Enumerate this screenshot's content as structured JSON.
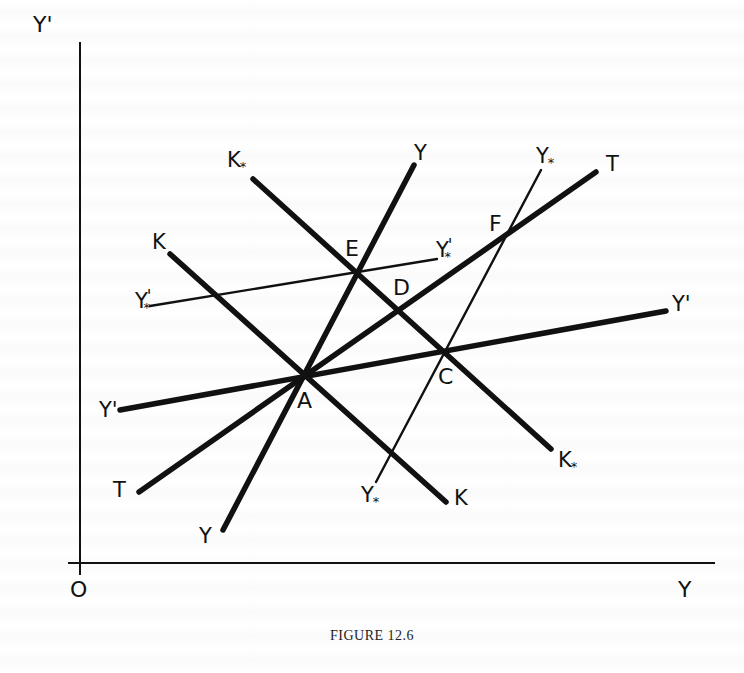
{
  "figure": {
    "caption": "FIGURE 12.6",
    "axes": {
      "origin_label": "O",
      "x_label": "Y",
      "y_label": "Y'",
      "origin": [
        80,
        563
      ],
      "x_end": [
        715,
        563
      ],
      "y_end": [
        80,
        42
      ]
    },
    "lines": [
      {
        "id": "Y",
        "weight": "thick",
        "from": [
          223,
          530
        ],
        "to": [
          414,
          165
        ],
        "labels": [
          "Y",
          "Y"
        ]
      },
      {
        "id": "T",
        "weight": "thick",
        "from": [
          139,
          492
        ],
        "to": [
          596,
          172
        ],
        "labels": [
          "T",
          "T"
        ]
      },
      {
        "id": "Yprime",
        "weight": "thick",
        "from": [
          120,
          410
        ],
        "to": [
          666,
          311
        ],
        "labels": [
          "Y'",
          "Y'"
        ]
      },
      {
        "id": "K",
        "weight": "thick",
        "from": [
          170,
          254
        ],
        "to": [
          446,
          502
        ],
        "labels": [
          "K",
          "K"
        ]
      },
      {
        "id": "Kstar",
        "weight": "thick",
        "from": [
          253,
          179
        ],
        "to": [
          551,
          449
        ],
        "labels": [
          "K*",
          "K*"
        ]
      },
      {
        "id": "Ystar",
        "weight": "thin",
        "from": [
          376,
          482
        ],
        "to": [
          541,
          170
        ],
        "labels": [
          "Y*",
          "Y*"
        ]
      },
      {
        "id": "Yprimestar",
        "weight": "thin",
        "from": [
          150,
          306
        ],
        "to": [
          437,
          259
        ],
        "labels": [
          "Y'*",
          "Y'*"
        ]
      }
    ],
    "points": [
      {
        "label": "A",
        "x": 305,
        "y": 377
      },
      {
        "label": "C",
        "x": 444,
        "y": 352
      },
      {
        "label": "D",
        "x": 398,
        "y": 311
      },
      {
        "label": "E",
        "x": 357,
        "y": 272
      },
      {
        "label": "F",
        "x": 504,
        "y": 235
      }
    ],
    "text_labels": {
      "axis_y_top": "Y'",
      "axis_origin": "O",
      "axis_x_right": "Y",
      "Y_top": "Y",
      "Y_bottom": "Y",
      "T_top": "T",
      "T_bottom": "T",
      "Yprime_left": "Y'",
      "Yprime_right": "Y'",
      "K_top": "K",
      "K_bottom": "K",
      "Kstar_top": "K",
      "Kstar_bottom": "K",
      "Ystar_top": "Y",
      "Ystar_bottom": "Y",
      "Yprimestar_left": "Y",
      "Yprimestar_right": "Y",
      "star": "*",
      "prime": "'",
      "point_A": "A",
      "point_C": "C",
      "point_D": "D",
      "point_E": "E",
      "point_F": "F"
    },
    "colors": {
      "ink": "#111111",
      "paper": "#ffffff"
    }
  }
}
